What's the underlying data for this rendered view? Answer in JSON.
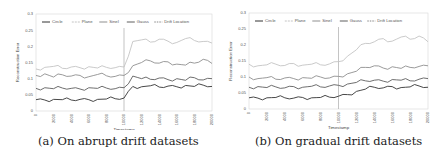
{
  "chart_data": [
    {
      "type": "line",
      "title": "",
      "caption": "(a) On abrupt drift datasets",
      "xlabel": "Timestamp",
      "ylabel": "Reconstruction Error",
      "x": [
        0,
        1000,
        2000,
        3000,
        4000,
        5000,
        6000,
        7000,
        8000,
        9000,
        10000,
        11000,
        12000,
        13000,
        14000,
        15000,
        16000,
        17000,
        18000,
        19000,
        20000
      ],
      "xticks": [
        "0",
        "2000",
        "4000",
        "6000",
        "8000",
        "10000",
        "12000",
        "14000",
        "16000",
        "18000",
        "20000"
      ],
      "yticks": [
        "0",
        "0.05",
        "0.1",
        "0.15",
        "0.2",
        "0.25",
        "0.3"
      ],
      "ylim": [
        0,
        0.3
      ],
      "xlim": [
        0,
        20000
      ],
      "grid": false,
      "legend_position": "top-left inside",
      "drift_location": 10000,
      "series": [
        {
          "name": "Circle",
          "color": "#333333",
          "values": [
            0.035,
            0.034,
            0.036,
            0.035,
            0.034,
            0.036,
            0.035,
            0.036,
            0.037,
            0.038,
            0.04,
            0.076,
            0.075,
            0.078,
            0.074,
            0.077,
            0.075,
            0.079,
            0.076,
            0.08,
            0.076
          ]
        },
        {
          "name": "Plane",
          "color": "#c4c4c4",
          "values": [
            0.13,
            0.135,
            0.138,
            0.132,
            0.136,
            0.134,
            0.137,
            0.133,
            0.135,
            0.134,
            0.136,
            0.215,
            0.22,
            0.213,
            0.222,
            0.216,
            0.212,
            0.224,
            0.218,
            0.215,
            0.21
          ]
        },
        {
          "name": "SineI",
          "color": "#8f8f8f",
          "values": [
            0.11,
            0.115,
            0.105,
            0.112,
            0.108,
            0.11,
            0.106,
            0.113,
            0.109,
            0.107,
            0.11,
            0.14,
            0.15,
            0.155,
            0.148,
            0.152,
            0.145,
            0.142,
            0.148,
            0.16,
            0.147
          ]
        },
        {
          "name": "Gauss",
          "color": "#5e5e5e",
          "values": [
            0.07,
            0.072,
            0.069,
            0.071,
            0.07,
            0.068,
            0.072,
            0.07,
            0.071,
            0.069,
            0.072,
            0.108,
            0.1,
            0.098,
            0.102,
            0.097,
            0.1,
            0.095,
            0.103,
            0.096,
            0.1
          ]
        }
      ]
    },
    {
      "type": "line",
      "title": "",
      "caption": "(b) On gradual drift datasets",
      "xlabel": "Timestamp",
      "ylabel": "Reconstruction Error",
      "x": [
        0,
        1000,
        2000,
        3000,
        4000,
        5000,
        6000,
        7000,
        8000,
        9000,
        10000,
        11000,
        12000,
        13000,
        14000,
        15000,
        16000,
        17000,
        18000,
        19000,
        20000
      ],
      "xticks": [
        "0",
        "2000",
        "4000",
        "6000",
        "8000",
        "10000",
        "12000",
        "14000",
        "16000",
        "18000",
        "20000"
      ],
      "yticks": [
        "0",
        "0.05",
        "0.1",
        "0.15",
        "0.2",
        "0.25",
        "0.3"
      ],
      "ylim": [
        0,
        0.3
      ],
      "xlim": [
        0,
        20000
      ],
      "grid": false,
      "legend_position": "top-left inside",
      "drift_location": 10000,
      "series": [
        {
          "name": "Circle",
          "color": "#333333",
          "values": [
            0.035,
            0.034,
            0.035,
            0.036,
            0.035,
            0.034,
            0.036,
            0.035,
            0.036,
            0.037,
            0.04,
            0.045,
            0.055,
            0.062,
            0.068,
            0.066,
            0.07,
            0.067,
            0.069,
            0.072,
            0.068
          ]
        },
        {
          "name": "Plane",
          "color": "#c4c4c4",
          "values": [
            0.14,
            0.135,
            0.138,
            0.14,
            0.136,
            0.142,
            0.137,
            0.14,
            0.138,
            0.141,
            0.148,
            0.165,
            0.185,
            0.205,
            0.21,
            0.22,
            0.212,
            0.225,
            0.218,
            0.228,
            0.21
          ]
        },
        {
          "name": "SineI",
          "color": "#8f8f8f",
          "values": [
            0.1,
            0.095,
            0.098,
            0.093,
            0.097,
            0.095,
            0.098,
            0.096,
            0.1,
            0.097,
            0.102,
            0.11,
            0.118,
            0.13,
            0.135,
            0.128,
            0.132,
            0.127,
            0.13,
            0.133,
            0.135
          ]
        },
        {
          "name": "Gauss",
          "color": "#5e5e5e",
          "values": [
            0.068,
            0.07,
            0.067,
            0.069,
            0.066,
            0.07,
            0.068,
            0.071,
            0.069,
            0.072,
            0.074,
            0.078,
            0.083,
            0.088,
            0.09,
            0.087,
            0.092,
            0.09,
            0.088,
            0.093,
            0.095
          ]
        }
      ]
    }
  ],
  "legend": {
    "items": [
      "Circle",
      "Plane",
      "SineI",
      "Gauss",
      "Drift Location"
    ]
  },
  "captions": {
    "a": "(a) On abrupt drift datasets",
    "b": "(b) On gradual drift datasets"
  }
}
